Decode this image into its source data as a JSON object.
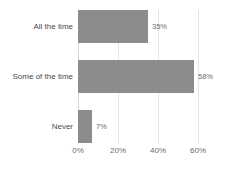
{
  "chart_data": {
    "type": "bar",
    "orientation": "horizontal",
    "title": "",
    "subtitle": "",
    "xlabel": "",
    "ylabel": "",
    "categories": [
      "All the time",
      "Some of the time",
      "Never"
    ],
    "values": [
      35,
      58,
      7
    ],
    "value_labels": [
      "35%",
      "58%",
      "7%"
    ],
    "tick_labels": [
      "0%",
      "20%",
      "40%",
      "60%"
    ],
    "tick_values": [
      0,
      20,
      40,
      60
    ],
    "xlim": [
      0,
      70
    ],
    "grid": true,
    "grid_axis": "x",
    "legend": false,
    "legend_position": "none",
    "series": [
      {
        "name": "",
        "values": [
          35,
          58,
          7
        ]
      }
    ],
    "colors": {
      "bar": "#8c8c8c",
      "background": "#ffffff",
      "gridline": "#e4e4e4",
      "category_text": "#4a4a4a",
      "tick_text": "#6d6d6d",
      "value_text": "#6d6d6d"
    }
  }
}
